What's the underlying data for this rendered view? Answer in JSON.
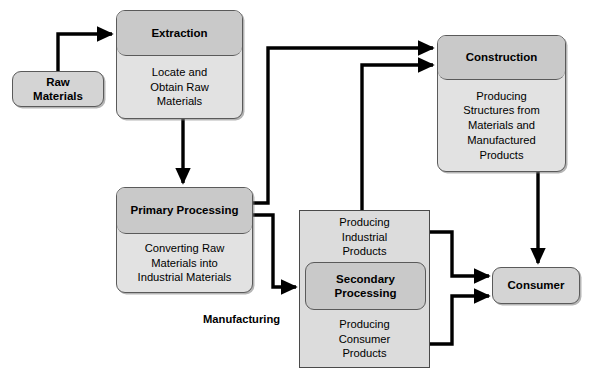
{
  "diagram": {
    "caption_manufacturing": "Manufacturing",
    "colors": {
      "node_header_fill": "#c9c9c9",
      "node_body_fill": "#e2e2e2",
      "node_border": "#5a5a5a",
      "square_fill": "#dcdcdc",
      "square_border": "#4a4a4a",
      "line": "#000000",
      "background": "#ffffff"
    }
  },
  "nodes": {
    "raw_materials": {
      "label": "Raw\nMaterials"
    },
    "extraction": {
      "header": "Extraction",
      "body": "Locate and\nObtain Raw\nMaterials"
    },
    "primary_processing": {
      "header": "Primary\nProcessing",
      "body": "Converting Raw\nMaterials into\nIndustrial Materials"
    },
    "secondary_processing": {
      "top_band": "Producing\nIndustrial\nProducts",
      "header": "Secondary\nProcessing",
      "bottom_band": "Producing\nConsumer\nProducts"
    },
    "construction": {
      "header": "Construction",
      "body": "Producing\nStructures from\nMaterials and\nManufactured\nProducts"
    },
    "consumer": {
      "label": "Consumer"
    }
  },
  "edges": [
    {
      "id": "raw-to-extraction",
      "from": "raw_materials",
      "to": "extraction",
      "label": ""
    },
    {
      "id": "extraction-to-primary",
      "from": "extraction",
      "to": "primary_processing",
      "label": ""
    },
    {
      "id": "primary-to-construction",
      "from": "primary_processing",
      "to": "construction",
      "label": ""
    },
    {
      "id": "primary-to-secondary",
      "from": "primary_processing",
      "to": "secondary_processing",
      "label": ""
    },
    {
      "id": "secondary-to-construction",
      "from": "secondary_processing",
      "to": "construction",
      "label": ""
    },
    {
      "id": "secondary-industrial-to-consumer",
      "from": "secondary_processing",
      "to": "consumer",
      "label": ""
    },
    {
      "id": "secondary-consumer-to-consumer",
      "from": "secondary_processing",
      "to": "consumer",
      "label": ""
    },
    {
      "id": "construction-to-consumer",
      "from": "construction",
      "to": "consumer",
      "label": ""
    }
  ]
}
